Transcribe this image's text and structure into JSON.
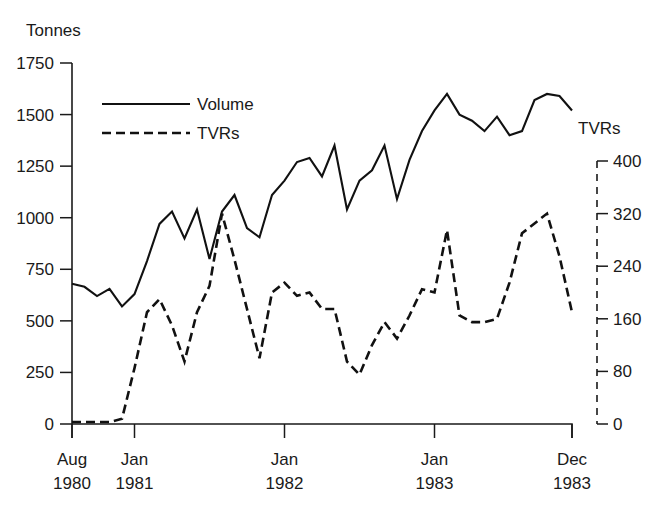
{
  "chart_data": {
    "type": "line",
    "title": "",
    "xlabel": "",
    "ylabel": "Tonnes",
    "y2label": "TVRs",
    "grid": false,
    "legend_position": "top-left",
    "ylim": [
      0,
      1750
    ],
    "y2lim": [
      0,
      400
    ],
    "yticks": [
      0,
      250,
      500,
      750,
      1000,
      1250,
      1500,
      1750
    ],
    "y2ticks": [
      0,
      80,
      160,
      240,
      320,
      400
    ],
    "xticks": [
      {
        "label_month": "Aug",
        "label_year": "1980",
        "index": 0
      },
      {
        "label_month": "Jan",
        "label_year": "1981",
        "index": 5
      },
      {
        "label_month": "Jan",
        "label_year": "1982",
        "index": 17
      },
      {
        "label_month": "Jan",
        "label_year": "1983",
        "index": 29
      },
      {
        "label_month": "Dec",
        "label_year": "1983",
        "index": 40
      }
    ],
    "x": [
      "Aug 1980",
      "Sep 1980",
      "Oct 1980",
      "Nov 1980",
      "Dec 1980",
      "Jan 1981",
      "Feb 1981",
      "Mar 1981",
      "Apr 1981",
      "May 1981",
      "Jun 1981",
      "Jul 1981",
      "Aug 1981",
      "Sep 1981",
      "Oct 1981",
      "Nov 1981",
      "Dec 1981",
      "Jan 1982",
      "Feb 1982",
      "Mar 1982",
      "Apr 1982",
      "May 1982",
      "Jun 1982",
      "Jul 1982",
      "Aug 1982",
      "Sep 1982",
      "Oct 1982",
      "Nov 1982",
      "Dec 1982",
      "Jan 1983",
      "Feb 1983",
      "Mar 1983",
      "Apr 1983",
      "May 1983",
      "Jun 1983",
      "Jul 1983",
      "Aug 1983",
      "Sep 1983",
      "Oct 1983",
      "Nov 1983",
      "Dec 1983"
    ],
    "series": [
      {
        "name": "Volume",
        "axis": "left",
        "unit": "Tonnes",
        "style": "solid",
        "values": [
          680,
          665,
          620,
          655,
          570,
          630,
          790,
          970,
          1030,
          900,
          1040,
          800,
          1030,
          1110,
          950,
          905,
          1110,
          1180,
          1270,
          1290,
          1200,
          1350,
          1040,
          1180,
          1230,
          1350,
          1090,
          1280,
          1420,
          1520,
          1600,
          1500,
          1470,
          1420,
          1490,
          1400,
          1420,
          1570,
          1600,
          1590,
          1520
        ]
      },
      {
        "name": "TVRs",
        "axis": "right",
        "unit": "TVRs",
        "style": "dashed",
        "values": [
          3,
          3,
          3,
          3,
          8,
          85,
          170,
          190,
          150,
          95,
          170,
          210,
          320,
          250,
          175,
          100,
          200,
          215,
          195,
          200,
          175,
          175,
          95,
          75,
          120,
          155,
          130,
          165,
          205,
          200,
          295,
          165,
          155,
          155,
          160,
          215,
          290,
          305,
          320,
          255,
          170
        ]
      }
    ],
    "legend": [
      {
        "label": "Volume",
        "style": "solid"
      },
      {
        "label": "TVRs",
        "style": "dashed"
      }
    ]
  },
  "labels": {
    "y_axis_title": "Tonnes",
    "y2_axis_title": "TVRs"
  }
}
